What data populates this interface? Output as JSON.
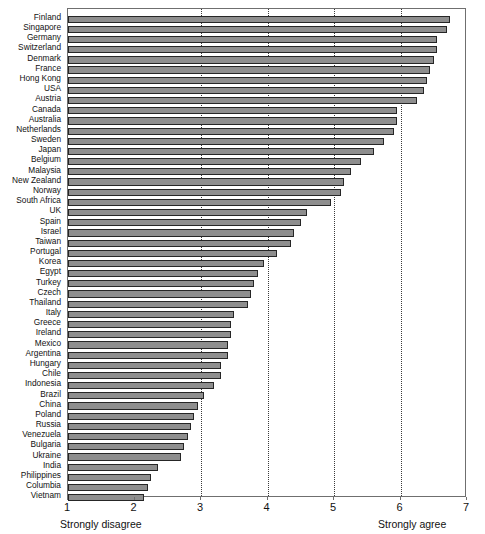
{
  "chart": {
    "type": "bar",
    "orientation": "horizontal",
    "title": "",
    "subtitle": "",
    "xlabel": "",
    "ylabel": "",
    "xlim": [
      1,
      7
    ],
    "xticks": [
      1,
      2,
      3,
      4,
      5,
      6,
      7
    ],
    "xtick_labels": [
      "1",
      "2",
      "3",
      "4",
      "5",
      "6",
      "7"
    ],
    "gridlines_x": [
      3,
      4,
      5,
      6
    ],
    "grid": true,
    "legend": null,
    "bar_color": "#8e8e8e",
    "bar_edge_color": "#262626",
    "axis_color": "#6f6f6f",
    "axis_caption_left": "Strongly disagree",
    "axis_caption_right": "Strongly agree"
  },
  "chart_data": {
    "type": "bar",
    "orientation": "horizontal",
    "title": "",
    "xlabel": "",
    "ylabel": "",
    "xlim": [
      1,
      7
    ],
    "xticks": [
      1,
      2,
      3,
      4,
      5,
      6,
      7
    ],
    "grid": true,
    "gridlines_x": [
      3,
      4,
      5,
      6
    ],
    "legend_position": "none",
    "annotations": [
      "Strongly disagree",
      "Strongly agree"
    ],
    "categories": [
      "Finland",
      "Singapore",
      "Germany",
      "Switzerland",
      "Denmark",
      "France",
      "Hong Kong",
      "USA",
      "Austria",
      "Canada",
      "Australia",
      "Netherlands",
      "Sweden",
      "Japan",
      "Belgium",
      "Malaysia",
      "New Zealand",
      "Norway",
      "South Africa",
      "UK",
      "Spain",
      "Israel",
      "Taiwan",
      "Portugal",
      "Korea",
      "Egypt",
      "Turkey",
      "Czech",
      "Thailand",
      "Italy",
      "Greece",
      "Ireland",
      "Mexico",
      "Argentina",
      "Hungary",
      "Chile",
      "Indonesia",
      "Brazil",
      "China",
      "Poland",
      "Russia",
      "Venezuela",
      "Bulgaria",
      "Ukraine",
      "India",
      "Philippines",
      "Columbia",
      "Vietnam"
    ],
    "values": [
      6.75,
      6.7,
      6.55,
      6.55,
      6.5,
      6.45,
      6.4,
      6.35,
      6.25,
      5.95,
      5.95,
      5.9,
      5.75,
      5.6,
      5.4,
      5.25,
      5.15,
      5.1,
      4.95,
      4.6,
      4.5,
      4.4,
      4.35,
      4.15,
      3.95,
      3.85,
      3.8,
      3.75,
      3.7,
      3.5,
      3.45,
      3.45,
      3.4,
      3.4,
      3.3,
      3.3,
      3.2,
      3.05,
      2.95,
      2.9,
      2.85,
      2.8,
      2.75,
      2.7,
      2.35,
      2.25,
      2.2,
      2.15
    ]
  }
}
